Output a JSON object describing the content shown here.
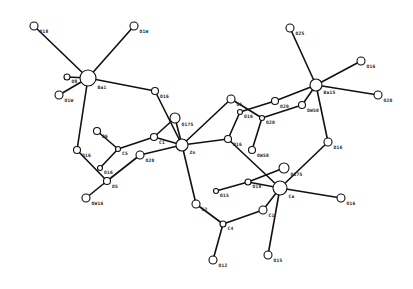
{
  "figure": {
    "type": "molecular-structure-diagram",
    "background": "#ffffff",
    "ink": "#111111"
  },
  "atoms": [
    {
      "id": "M1",
      "label": "Ba1",
      "x": 88,
      "y": 78,
      "r": 8
    },
    {
      "id": "O1",
      "label": "O18",
      "x": 34,
      "y": 26,
      "r": 4
    },
    {
      "id": "O2",
      "label": "O1W",
      "x": 134,
      "y": 26,
      "r": 4
    },
    {
      "id": "O3",
      "label": "O8",
      "x": 67,
      "y": 77,
      "r": 3
    },
    {
      "id": "O4",
      "label": "O1W",
      "x": 59,
      "y": 95,
      "r": 4
    },
    {
      "id": "O5",
      "label": "O16",
      "x": 155,
      "y": 91,
      "r": 3.5
    },
    {
      "id": "O6",
      "label": "O16",
      "x": 77,
      "y": 150,
      "r": 3.5
    },
    {
      "id": "C1",
      "label": "C5",
      "x": 118,
      "y": 149,
      "r": 2.5
    },
    {
      "id": "O7",
      "label": "O6",
      "x": 97,
      "y": 131,
      "r": 3.5
    },
    {
      "id": "O8",
      "label": "O16",
      "x": 100,
      "y": 168,
      "r": 2.5
    },
    {
      "id": "O9",
      "label": "O5",
      "x": 107,
      "y": 181,
      "r": 3.5
    },
    {
      "id": "O10",
      "label": "OW16",
      "x": 86,
      "y": 198,
      "r": 4
    },
    {
      "id": "O11",
      "label": "O20",
      "x": 140,
      "y": 155,
      "r": 4
    },
    {
      "id": "C2",
      "label": "C1",
      "x": 154,
      "y": 137,
      "r": 3.5
    },
    {
      "id": "O12",
      "label": "O17S",
      "x": 175,
      "y": 118,
      "r": 5
    },
    {
      "id": "M2",
      "label": "Zn",
      "x": 182,
      "y": 145,
      "r": 6
    },
    {
      "id": "O13",
      "label": "O5",
      "x": 231,
      "y": 99,
      "r": 4
    },
    {
      "id": "C3",
      "label": "O16",
      "x": 240,
      "y": 112,
      "r": 2.5
    },
    {
      "id": "O14",
      "label": "O16",
      "x": 228,
      "y": 139,
      "r": 3.5
    },
    {
      "id": "C4",
      "label": "O20",
      "x": 262,
      "y": 118,
      "r": 2.5
    },
    {
      "id": "O15",
      "label": "O20",
      "x": 275,
      "y": 101,
      "r": 3.5
    },
    {
      "id": "O16",
      "label": "OW50",
      "x": 302,
      "y": 105,
      "r": 3.5
    },
    {
      "id": "O17",
      "label": "OW50",
      "x": 252,
      "y": 150,
      "r": 3.5
    },
    {
      "id": "M3",
      "label": "Ba1S",
      "x": 316,
      "y": 85,
      "r": 6
    },
    {
      "id": "O18",
      "label": "O2S",
      "x": 290,
      "y": 28,
      "r": 4
    },
    {
      "id": "O19",
      "label": "O16",
      "x": 361,
      "y": 61,
      "r": 4
    },
    {
      "id": "O20",
      "label": "O20",
      "x": 378,
      "y": 95,
      "r": 4
    },
    {
      "id": "O21",
      "label": "O16",
      "x": 328,
      "y": 142,
      "r": 4
    },
    {
      "id": "O22",
      "label": "O17S",
      "x": 284,
      "y": 168,
      "r": 5
    },
    {
      "id": "C5",
      "label": "O18",
      "x": 248,
      "y": 182,
      "r": 3
    },
    {
      "id": "O23",
      "label": "O15",
      "x": 216,
      "y": 191,
      "r": 2.5
    },
    {
      "id": "M4",
      "label": "Ca",
      "x": 280,
      "y": 188,
      "r": 7
    },
    {
      "id": "O24",
      "label": "O16",
      "x": 341,
      "y": 198,
      "r": 4
    },
    {
      "id": "O25",
      "label": "C2",
      "x": 196,
      "y": 204,
      "r": 4
    },
    {
      "id": "C6",
      "label": "C1",
      "x": 263,
      "y": 210,
      "r": 4
    },
    {
      "id": "C7",
      "label": "C4",
      "x": 223,
      "y": 224,
      "r": 3
    },
    {
      "id": "O26",
      "label": "O12",
      "x": 213,
      "y": 260,
      "r": 4
    },
    {
      "id": "O27",
      "label": "O1S",
      "x": 268,
      "y": 255,
      "r": 4
    }
  ],
  "bonds": [
    [
      "M1",
      "O1"
    ],
    [
      "M1",
      "O2"
    ],
    [
      "M1",
      "O3"
    ],
    [
      "M1",
      "O4"
    ],
    [
      "M1",
      "O5"
    ],
    [
      "M1",
      "O6"
    ],
    [
      "O6",
      "O9"
    ],
    [
      "O9",
      "O10"
    ],
    [
      "O9",
      "O11"
    ],
    [
      "O7",
      "C1"
    ],
    [
      "C1",
      "C2"
    ],
    [
      "C1",
      "O8"
    ],
    [
      "O11",
      "M2"
    ],
    [
      "C2",
      "M2"
    ],
    [
      "C2",
      "O12"
    ],
    [
      "O5",
      "M2"
    ],
    [
      "O12",
      "M2"
    ],
    [
      "M2",
      "O13"
    ],
    [
      "M2",
      "O14"
    ],
    [
      "M2",
      "O25"
    ],
    [
      "O13",
      "C4"
    ],
    [
      "C3",
      "O14"
    ],
    [
      "C3",
      "O15"
    ],
    [
      "O15",
      "M3"
    ],
    [
      "C4",
      "O16"
    ],
    [
      "O16",
      "M3"
    ],
    [
      "C4",
      "O17"
    ],
    [
      "M3",
      "O18"
    ],
    [
      "M3",
      "O19"
    ],
    [
      "M3",
      "O20"
    ],
    [
      "M3",
      "O21"
    ],
    [
      "O21",
      "M4"
    ],
    [
      "O14",
      "M4"
    ],
    [
      "O22",
      "C5"
    ],
    [
      "C5",
      "M4"
    ],
    [
      "O23",
      "C5"
    ],
    [
      "M4",
      "O24"
    ],
    [
      "M4",
      "C6"
    ],
    [
      "M4",
      "O27"
    ],
    [
      "O25",
      "C7"
    ],
    [
      "C7",
      "C6"
    ],
    [
      "C7",
      "O26"
    ]
  ]
}
